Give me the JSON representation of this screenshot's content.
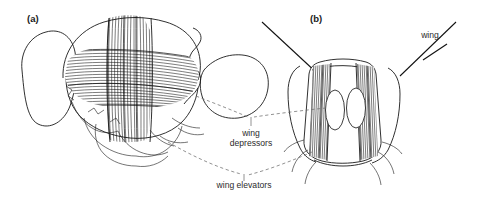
{
  "figure": {
    "background_color": "#ffffff",
    "ink_color": "#1a1a1a",
    "leader_color": "#6e6e6e",
    "panels": [
      {
        "id": "a",
        "label": "(a)",
        "label_x": 27,
        "label_y": 22,
        "description": "lateral view of insect thorax showing dorsal longitudinal wing depressor muscles and dorsoventral wing elevator muscles"
      },
      {
        "id": "b",
        "label": "(b)",
        "label_x": 310,
        "label_y": 22,
        "description": "frontal cross-section of thorax showing paired longitudinal muscles and lateral dorsoventral muscle bundles"
      }
    ],
    "callouts": [
      {
        "id": "wing",
        "lines": [
          "wing"
        ],
        "x": 430,
        "y": 38,
        "leader": "line from label down-left to right wing base"
      },
      {
        "id": "wing-depressors",
        "lines": [
          "wing",
          "depressors"
        ],
        "x": 251,
        "y": 136,
        "line_height": 10,
        "leader": "dashed V from both panels to tick above label"
      },
      {
        "id": "wing-elevators",
        "lines": [
          "wing elevators"
        ],
        "x": 244,
        "y": 188,
        "line_height": 10,
        "leader": "dashed V from both panels to tick above label"
      }
    ],
    "structures": {
      "longitudinal_muscles_label": "wing depressors",
      "dorsoventral_muscles_label": "wing elevators",
      "wing_label": "wing",
      "stippled_oval_count": 2
    }
  }
}
